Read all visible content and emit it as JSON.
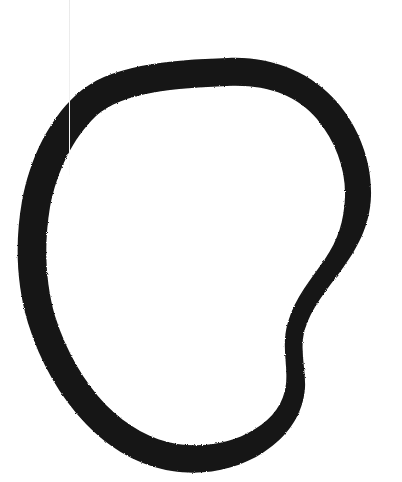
{
  "image": {
    "kind": "natural-image",
    "subject": "hand-drawn-closed-loop",
    "description": "A single thick hand-drawn black closed loop (irregular oval / circle) on a plain white background, with a concave notch on the right side.",
    "width": 402,
    "height": 482,
    "alt_text": "Thick black hand-drawn oval outline on white paper"
  },
  "colors": {
    "background": "#ffffff",
    "stroke": "#141414",
    "stroke_edge": "#2a2a2a",
    "artifact_line": "#ececec"
  },
  "shape": {
    "name": "irregular-oval-loop",
    "closed": true,
    "fill_rule": "evenodd",
    "stroke_width_px": 27,
    "bounds": {
      "left": 18,
      "top": 57,
      "right": 372,
      "bottom": 471
    },
    "center": {
      "x": 190,
      "y": 265
    },
    "outer_path": "M 228 58 C 272 56 312 73 337 102 C 360 129 372 163 371 196 C 370 226 357 249 340 272 C 325 292 311 309 305 329 C 299 349 306 368 305 388 C 303 415 287 437 264 452 C 237 470 203 476 172 471 C 140 466 110 449 86 424 C 60 397 40 362 28 323 C 16 283 15 241 22 201 C 30 159 48 121 76 95 C 108 65 167 60 228 58 Z",
    "inner_path": "M 227 86 C 176 88 122 92 96 116 C 73 138 57 171 50 207 C 44 243 45 281 55 316 C 66 351 84 382 106 405 C 127 426 152 440 177 444 C 204 448 233 443 255 429 C 273 418 284 403 286 384 C 288 364 281 345 288 322 C 295 298 311 279 325 259 C 338 240 344 221 345 197 C 346 170 336 142 317 119 C 297 95 266 84 227 86 Z",
    "vertices_outer": [
      [
        228,
        58
      ],
      [
        290,
        64
      ],
      [
        337,
        102
      ],
      [
        371,
        196
      ],
      [
        340,
        272
      ],
      [
        305,
        329
      ],
      [
        305,
        388
      ],
      [
        264,
        452
      ],
      [
        172,
        471
      ],
      [
        86,
        424
      ],
      [
        28,
        323
      ],
      [
        22,
        201
      ],
      [
        76,
        95
      ]
    ]
  },
  "artifacts": [
    {
      "name": "vertical-scan-line",
      "type": "faint-vertical-line",
      "x": 69,
      "y_start": 0,
      "y_end": 175,
      "color": "#ececec"
    }
  ]
}
